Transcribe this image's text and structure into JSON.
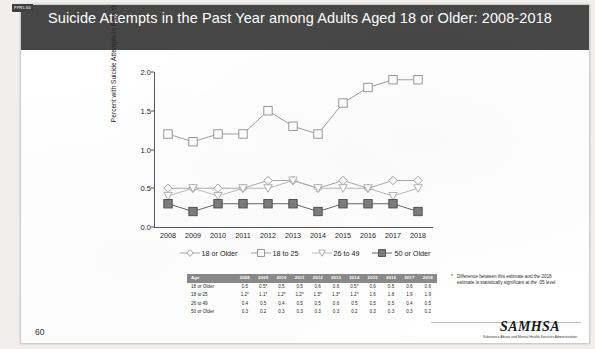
{
  "figure_tag": "FFR1.60",
  "header": {
    "title": "Suicide Attempts in the Past Year among Adults Aged 18 or Older: 2008-2018"
  },
  "page_number": "60",
  "footnote": {
    "marker": "*",
    "text": "Difference between this estimate and the 2018 estimate is statistically significant at the .05 level."
  },
  "logo": {
    "name": "SAMHSA",
    "subtitle": "Substance Abuse and Mental Health Services Administration"
  },
  "chart_data": {
    "type": "line",
    "title": "Suicide Attempts in the Past Year among Adults Aged 18 or Older: 2008-2018",
    "xlabel": "",
    "ylabel": "Percent with Suicide Attempts in Past Year",
    "categories": [
      "2008",
      "2009",
      "2010",
      "2011",
      "2012",
      "2013",
      "2014",
      "2015",
      "2016",
      "2017",
      "2018"
    ],
    "ylim": [
      0.0,
      2.0
    ],
    "yticks": [
      "0.0",
      "0.5",
      "1.0",
      "1.5",
      "2.0"
    ],
    "ytick_values": [
      0.0,
      0.5,
      1.0,
      1.5,
      2.0
    ],
    "grid": false,
    "legend_position": "bottom",
    "series": [
      {
        "name": "18 or Older",
        "marker": "diamond",
        "color": "#9a9a9a",
        "values": [
          0.5,
          0.5,
          0.5,
          0.5,
          0.6,
          0.6,
          0.5,
          0.6,
          0.5,
          0.6,
          0.6
        ],
        "significance": [
          false,
          true,
          false,
          false,
          false,
          false,
          true,
          false,
          false,
          false,
          false
        ]
      },
      {
        "name": "18 to 25",
        "marker": "square",
        "color": "#8e8e8e",
        "values": [
          1.2,
          1.1,
          1.2,
          1.2,
          1.5,
          1.3,
          1.2,
          1.6,
          1.8,
          1.9,
          1.9
        ],
        "significance": [
          true,
          true,
          true,
          true,
          true,
          true,
          true,
          false,
          false,
          false,
          false
        ]
      },
      {
        "name": "26 to 49",
        "marker": "triangle-down",
        "color": "#adadad",
        "values": [
          0.4,
          0.5,
          0.4,
          0.5,
          0.5,
          0.6,
          0.5,
          0.5,
          0.5,
          0.4,
          0.5
        ],
        "significance": [
          false,
          false,
          false,
          false,
          false,
          false,
          false,
          false,
          false,
          false,
          false
        ]
      },
      {
        "name": "50 or Older",
        "marker": "square-filled",
        "color": "#4a4a4a",
        "values": [
          0.3,
          0.2,
          0.3,
          0.3,
          0.3,
          0.3,
          0.2,
          0.3,
          0.3,
          0.3,
          0.2
        ],
        "significance": [
          false,
          false,
          false,
          false,
          false,
          false,
          false,
          false,
          false,
          false,
          false
        ]
      }
    ]
  },
  "table": {
    "header_label": "Age",
    "years": [
      "2008",
      "2009",
      "2010",
      "2011",
      "2012",
      "2013",
      "2014",
      "2015",
      "2016",
      "2017",
      "2018"
    ],
    "rows": [
      {
        "label": "18 or Older",
        "values": [
          "0.5",
          "0.5*",
          "0.5",
          "0.5",
          "0.6",
          "0.6",
          "0.5*",
          "0.6",
          "0.5",
          "0.6",
          "0.6"
        ]
      },
      {
        "label": "18 to 25",
        "values": [
          "1.2*",
          "1.1*",
          "1.2*",
          "1.2*",
          "1.5*",
          "1.3*",
          "1.2*",
          "1.6",
          "1.8",
          "1.9",
          "1.9"
        ]
      },
      {
        "label": "26 to 49",
        "values": [
          "0.4",
          "0.5",
          "0.4",
          "0.5",
          "0.5",
          "0.6",
          "0.5",
          "0.5",
          "0.5",
          "0.4",
          "0.5"
        ]
      },
      {
        "label": "50 or Older",
        "values": [
          "0.3",
          "0.2",
          "0.3",
          "0.3",
          "0.3",
          "0.3",
          "0.2",
          "0.3",
          "0.3",
          "0.3",
          "0.2"
        ]
      }
    ]
  }
}
